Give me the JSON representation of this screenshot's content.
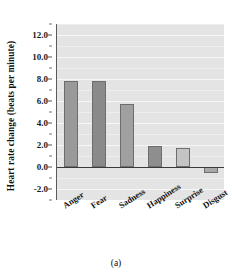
{
  "figure": {
    "caption": "(a)"
  },
  "chart_data": {
    "type": "bar",
    "title": "",
    "subtitle": "",
    "xlabel": "",
    "ylabel": "Heart rate change (beats per minute)",
    "categories": [
      "Anger",
      "Fear",
      "Sadness",
      "Happiness",
      "Surprise",
      "Disgust"
    ],
    "values": [
      7.8,
      7.8,
      5.7,
      1.9,
      1.7,
      -0.5
    ],
    "series": [
      {
        "name": "Heart rate change",
        "values": [
          7.8,
          7.8,
          5.7,
          1.9,
          1.7,
          -0.5
        ]
      }
    ],
    "bar_colors": [
      "#9a9a9a",
      "#8a8a8a",
      "#a0a0a0",
      "#8e8e8e",
      "#c4c4c4",
      "#a8a8a8"
    ],
    "ylim": [
      -3.0,
      13.0
    ],
    "yticks": [
      12.0,
      10.0,
      8.0,
      6.0,
      4.0,
      2.0,
      0.0,
      -2.0
    ],
    "ytick_labels": [
      "12.0",
      "10.0",
      "8.0",
      "6.0",
      "4.0",
      "2.0",
      "0.0",
      "-2.0"
    ],
    "minor_ytick_step": 1.0,
    "grid": true,
    "grid_axis": "y",
    "legend": false,
    "legend_position": "none",
    "zero_line": 0.0,
    "plot_background": "#e4e4e4",
    "gridline_color": "#f7f7f7",
    "axis_color": "#5a5a5a",
    "annotations": []
  }
}
